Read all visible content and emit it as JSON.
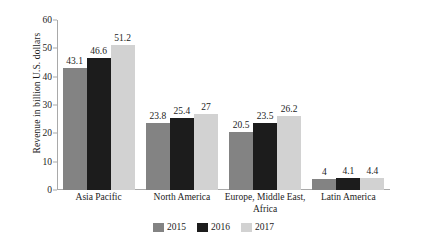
{
  "chart_data": {
    "type": "bar",
    "title": "",
    "subtitle": "",
    "xlabel": "",
    "ylabel": "Revenue in billion U.S. dollars",
    "ylim": [
      0,
      60
    ],
    "yticks": [
      0,
      10,
      20,
      30,
      40,
      50,
      60
    ],
    "ytick_labels": [
      "0",
      "10",
      "20",
      "30",
      "40",
      "50",
      "60"
    ],
    "grid": false,
    "legend_position": "bottom-center",
    "categories": [
      {
        "line1": "Asia Pacific",
        "line2": ""
      },
      {
        "line1": "North America",
        "line2": ""
      },
      {
        "line1": "Europe, Middle East,",
        "line2": "Africa"
      },
      {
        "line1": "Latin America",
        "line2": ""
      }
    ],
    "category_names": [
      "Asia Pacific",
      "North America",
      "Europe, Middle East, Africa",
      "Latin America"
    ],
    "series": [
      {
        "name": "2015",
        "color": "#838383",
        "values": [
          43.1,
          23.8,
          20.5,
          4
        ],
        "labels": [
          "43.1",
          "23.8",
          "20.5",
          "4"
        ]
      },
      {
        "name": "2016",
        "color": "#1c1c1c",
        "values": [
          46.6,
          25.4,
          23.5,
          4.1
        ],
        "labels": [
          "46.6",
          "25.4",
          "23.5",
          "4.1"
        ]
      },
      {
        "name": "2017",
        "color": "#d2d2d2",
        "values": [
          51.2,
          27,
          26.2,
          4.4
        ],
        "labels": [
          "51.2",
          "27",
          "26.2",
          "4.4"
        ]
      }
    ]
  },
  "legend": {
    "items": [
      {
        "label": "2015",
        "color": "#838383"
      },
      {
        "label": "2016",
        "color": "#1c1c1c"
      },
      {
        "label": "2017",
        "color": "#d2d2d2"
      }
    ]
  },
  "axis": {
    "y_title": "Revenue in billion U.S. dollars",
    "tick_60": "60",
    "tick_50": "50",
    "tick_40": "40",
    "tick_30": "30",
    "tick_20": "20",
    "tick_10": "10",
    "tick_0": "0"
  },
  "colors": {
    "axis_line": "#a9a9a9",
    "text": "#1c1c1c",
    "background": "#ffffff"
  }
}
